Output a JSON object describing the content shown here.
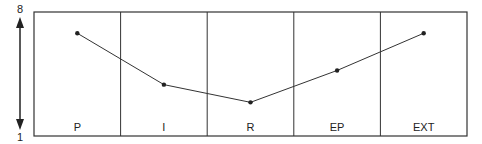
{
  "chart_data": {
    "type": "line",
    "title": "",
    "xlabel": "",
    "ylabel": "",
    "categories": [
      "P",
      "I",
      "R",
      "EP",
      "EXT"
    ],
    "values": [
      6.8,
      3.9,
      2.9,
      4.7,
      6.8
    ],
    "ylim": [
      1,
      8
    ],
    "y_axis_labels": {
      "top": "8",
      "bottom": "1"
    },
    "grid": false,
    "legend": null
  }
}
